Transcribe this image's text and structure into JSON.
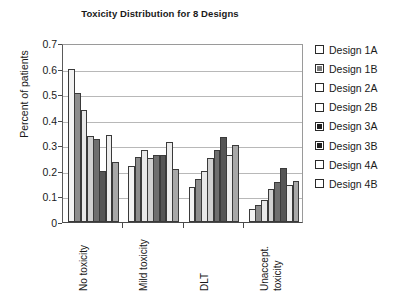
{
  "chart_data": {
    "type": "bar",
    "title": "Toxicity Distribution for 8 Designs",
    "xlabel": "",
    "ylabel": "Percent of patients",
    "ylim": [
      0,
      0.7
    ],
    "ytick_labels": [
      "0.7",
      "0.6",
      "0.5",
      "0.4",
      "0.3",
      "0.2",
      "0.1",
      "0"
    ],
    "ytick_values": [
      0.7,
      0.6,
      0.5,
      0.4,
      0.3,
      0.2,
      0.1,
      0
    ],
    "grid": true,
    "legend_position": "right",
    "categories": [
      "No toxicity",
      "Mild toxicity",
      "DLT",
      "Unaccept. toxicity"
    ],
    "category_lines": [
      [
        "No toxicity"
      ],
      [
        "Mild toxicity"
      ],
      [
        "DLT"
      ],
      [
        "Unaccept.",
        "toxicity"
      ]
    ],
    "series": [
      {
        "name": "Design 1A",
        "color": "#f2f2f2",
        "values": [
          0.6,
          0.22,
          0.135,
          0.05
        ]
      },
      {
        "name": "Design 1B",
        "color": "#8c8c8c",
        "values": [
          0.505,
          0.255,
          0.17,
          0.065
        ]
      },
      {
        "name": "Design 2A",
        "color": "#e8e8e8",
        "values": [
          0.44,
          0.28,
          0.2,
          0.085
        ]
      },
      {
        "name": "Design 2B",
        "color": "#d0d0d0",
        "values": [
          0.335,
          0.25,
          0.25,
          0.13
        ]
      },
      {
        "name": "Design 3A",
        "color": "#6e6e6e",
        "values": [
          0.325,
          0.262,
          0.282,
          0.155
        ]
      },
      {
        "name": "Design 3B",
        "color": "#555555",
        "values": [
          0.2,
          0.262,
          0.332,
          0.21
        ]
      },
      {
        "name": "Design 4A",
        "color": "#ededed",
        "values": [
          0.34,
          0.312,
          0.262,
          0.145
        ]
      },
      {
        "name": "Design 4B",
        "color": "#a8a8a8",
        "values": [
          0.235,
          0.208,
          0.302,
          0.16
        ]
      }
    ]
  },
  "legend": {
    "items": [
      {
        "label": "Design 1A",
        "swatch": "#ffffff"
      },
      {
        "label": "Design 1B",
        "swatch": "#7a7a7a"
      },
      {
        "label": "Design 2A",
        "swatch": "#ffffff"
      },
      {
        "label": "Design 2B",
        "swatch": "#ffffff"
      },
      {
        "label": "Design 3A",
        "swatch": "#1f1f1f"
      },
      {
        "label": "Design 3B",
        "swatch": "#1f1f1f"
      },
      {
        "label": "Design 4A",
        "swatch": "#ffffff"
      },
      {
        "label": "Design 4B",
        "swatch": "#ffffff"
      }
    ]
  }
}
